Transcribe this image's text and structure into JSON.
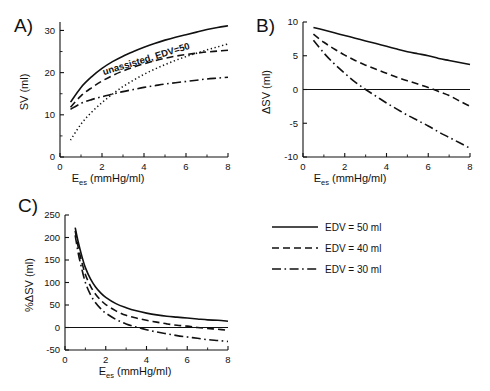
{
  "figure": {
    "background": "#ffffff",
    "ink": "#111111"
  },
  "panels": {
    "a": {
      "label": "A)",
      "xlabel_main": "E",
      "xlabel_sub": "es",
      "xlabel_unit": " (mmHg/ml)",
      "ylabel": "SV (ml)",
      "annotation": "unassisted, EDV=50"
    },
    "b": {
      "label": "B)",
      "xlabel_main": "E",
      "xlabel_sub": "es",
      "xlabel_unit": " (mmHg/ml)",
      "ylabel": "ΔSV (ml)"
    },
    "c": {
      "label": "C)",
      "xlabel_main": "E",
      "xlabel_sub": "es",
      "xlabel_unit": " (mmHg/ml)",
      "ylabel": "%ΔSV (ml)"
    }
  },
  "legend": {
    "position": "center-right",
    "items": [
      {
        "label": "EDV = 50 ml",
        "style": "solid"
      },
      {
        "label": "EDV = 40 ml",
        "style": "dashed"
      },
      {
        "label": "EDV = 30 ml",
        "style": "dashdot"
      }
    ]
  },
  "chart_data": [
    {
      "id": "panel-a",
      "type": "line",
      "title": "A)",
      "xlabel": "Ees (mmHg/ml)",
      "ylabel": "SV (ml)",
      "xlim": [
        0,
        8
      ],
      "ylim": [
        0,
        32
      ],
      "xticks": [
        0,
        2,
        4,
        6,
        8
      ],
      "xticks_minor": [
        1,
        3,
        5,
        7
      ],
      "yticks": [
        0,
        10,
        20,
        30
      ],
      "yticks_minor": [
        5,
        15,
        25
      ],
      "grid": false,
      "annotations": [
        {
          "text": "unassisted, EDV=50",
          "x": 4.1,
          "y": 24.0,
          "rotation": -17
        }
      ],
      "x": [
        0.5,
        1,
        1.5,
        2,
        2.5,
        3,
        3.5,
        4,
        4.5,
        5,
        5.5,
        6,
        6.5,
        7,
        7.5,
        8
      ],
      "series": [
        {
          "name": "EDV = 50 ml",
          "style": "solid",
          "values": [
            13.0,
            16.5,
            19.0,
            21.0,
            22.6,
            23.9,
            25.0,
            26.0,
            26.9,
            27.7,
            28.4,
            29.0,
            29.6,
            30.2,
            30.7,
            31.1
          ]
        },
        {
          "name": "unassisted, EDV=50",
          "style": "dotted",
          "values": [
            4.0,
            7.8,
            10.6,
            12.9,
            14.9,
            16.7,
            18.2,
            19.6,
            20.8,
            21.9,
            22.9,
            23.8,
            24.6,
            25.4,
            26.1,
            26.8
          ]
        },
        {
          "name": "EDV = 40 ml",
          "style": "dashed",
          "values": [
            11.8,
            14.5,
            16.4,
            18.0,
            19.3,
            20.4,
            21.3,
            22.1,
            22.8,
            23.4,
            23.9,
            24.3,
            24.6,
            24.9,
            25.1,
            25.3
          ]
        },
        {
          "name": "EDV = 30 ml",
          "style": "dashdot",
          "values": [
            11.3,
            12.7,
            13.6,
            14.3,
            14.9,
            15.5,
            16.0,
            16.5,
            16.9,
            17.3,
            17.6,
            17.9,
            18.2,
            18.5,
            18.7,
            18.9
          ]
        }
      ]
    },
    {
      "id": "panel-b",
      "type": "line",
      "title": "B)",
      "xlabel": "Ees (mmHg/ml)",
      "ylabel": "ΔSV (ml)",
      "xlim": [
        0,
        8
      ],
      "ylim": [
        -10,
        10
      ],
      "xticks": [
        0,
        2,
        4,
        6,
        8
      ],
      "xticks_minor": [
        1,
        3,
        5,
        7
      ],
      "yticks": [
        -10,
        -5,
        0,
        5,
        10
      ],
      "grid": false,
      "zeroline": true,
      "x": [
        0.5,
        1,
        1.5,
        2,
        2.5,
        3,
        3.5,
        4,
        4.5,
        5,
        5.5,
        6,
        6.5,
        7,
        7.5,
        8
      ],
      "series": [
        {
          "name": "EDV = 50 ml",
          "style": "solid",
          "values": [
            9.2,
            8.8,
            8.4,
            8.0,
            7.6,
            7.2,
            6.8,
            6.4,
            6.0,
            5.6,
            5.3,
            5.0,
            4.6,
            4.3,
            4.0,
            3.7
          ]
        },
        {
          "name": "EDV = 40 ml",
          "style": "dashed",
          "values": [
            8.2,
            7.0,
            6.0,
            5.1,
            4.3,
            3.6,
            3.0,
            2.4,
            1.8,
            1.3,
            0.8,
            0.3,
            -0.3,
            -0.9,
            -1.7,
            -2.5
          ]
        },
        {
          "name": "EDV = 30 ml",
          "style": "dashdot",
          "values": [
            7.3,
            5.4,
            3.8,
            2.4,
            1.1,
            0.0,
            -1.0,
            -2.0,
            -2.9,
            -3.8,
            -4.6,
            -5.4,
            -6.3,
            -7.1,
            -7.9,
            -8.7
          ]
        }
      ]
    },
    {
      "id": "panel-c",
      "type": "line",
      "title": "C)",
      "xlabel": "Ees (mmHg/ml)",
      "ylabel": "%ΔSV (ml)",
      "xlim": [
        0,
        8
      ],
      "ylim": [
        -50,
        250
      ],
      "xticks": [
        0,
        2,
        4,
        6,
        8
      ],
      "xticks_minor": [
        1,
        3,
        5,
        7
      ],
      "yticks": [
        -50,
        0,
        50,
        100,
        150,
        200,
        250
      ],
      "grid": false,
      "zeroline": true,
      "x": [
        0.5,
        0.65,
        0.8,
        1,
        1.25,
        1.5,
        1.75,
        2,
        2.5,
        3,
        3.5,
        4,
        4.5,
        5,
        5.5,
        6,
        6.5,
        7,
        7.5,
        8
      ],
      "series": [
        {
          "name": "EDV = 50 ml",
          "style": "solid",
          "values": [
            222,
            190,
            163,
            133,
            108,
            90,
            77,
            67,
            53,
            44,
            37,
            32,
            28,
            25,
            23,
            21,
            19,
            17,
            16,
            14
          ]
        },
        {
          "name": "EDV = 40 ml",
          "style": "dashed",
          "values": [
            215,
            178,
            150,
            118,
            92,
            74,
            61,
            51,
            37,
            27,
            21,
            16,
            12,
            8,
            5,
            3,
            0,
            -2,
            -4,
            -6
          ]
        },
        {
          "name": "EDV = 30 ml",
          "style": "dashdot",
          "values": [
            205,
            165,
            135,
            100,
            73,
            55,
            42,
            32,
            18,
            8,
            1,
            -5,
            -10,
            -14,
            -18,
            -21,
            -24,
            -27,
            -29,
            -31
          ]
        }
      ]
    }
  ]
}
